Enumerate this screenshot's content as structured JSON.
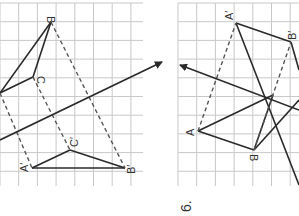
{
  "figure": {
    "width": 299,
    "height": 216,
    "colors": {
      "grid": "#c8c8c8",
      "solid": "#2a2a2a",
      "dashed": "#555555",
      "label": "#333333",
      "background": "#ffffff"
    }
  },
  "left_panel": {
    "grid": {
      "x": 0,
      "y": 3,
      "w": 143,
      "h": 183,
      "cell": 18.7
    },
    "points": {
      "A": [
        0,
        93
      ],
      "B": [
        51,
        22
      ],
      "C": [
        33,
        77
      ],
      "A_prime": [
        32,
        168
      ],
      "B_prime": [
        125,
        168
      ],
      "C_prime": [
        70,
        150
      ]
    },
    "labels": {
      "B": "B",
      "C": "C",
      "A_prime": "A′",
      "B_prime": "B′",
      "C_prime": "C′"
    },
    "translation_arrow": {
      "from": [
        0,
        140
      ],
      "to": [
        162,
        62
      ]
    }
  },
  "right_panel": {
    "grid": {
      "x": 178,
      "y": 3,
      "w": 121,
      "h": 183,
      "cell": 18.7
    },
    "points": {
      "A": [
        198,
        131
      ],
      "B": [
        254,
        150
      ],
      "A_prime": [
        236,
        23
      ],
      "B_prime": [
        291,
        42
      ],
      "center": [
        273,
        95
      ]
    },
    "labels": {
      "A": "A",
      "B": "B",
      "A_prime": "A′",
      "B_prime": "B′"
    },
    "arrow": {
      "from": [
        299,
        110
      ],
      "to": [
        180,
        65
      ]
    }
  },
  "problem_number": "6."
}
